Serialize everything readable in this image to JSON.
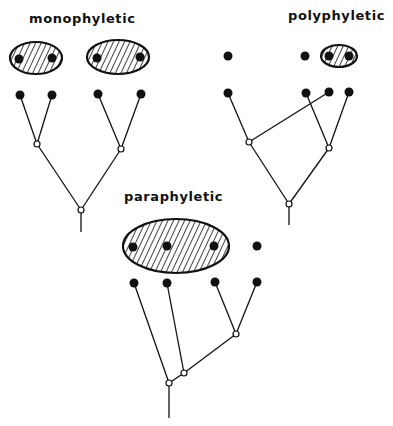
{
  "diagrams": {
    "monophyletic": {
      "title": "monophyletic",
      "groups": 2,
      "taxa": 4,
      "description": "Two groups, each containing a pair of sister taxa with their common ancestor"
    },
    "polyphyletic": {
      "title": "polyphyletic",
      "groups": 1,
      "taxa": 4,
      "description": "Group unites two taxa from separate lineages, excluding common ancestor"
    },
    "paraphyletic": {
      "title": "paraphyletic",
      "groups": 1,
      "taxa": 4,
      "description": "Group includes ancestor but not all of its descendants"
    }
  },
  "colors": {
    "ink": "#111111",
    "background": "#ffffff"
  }
}
